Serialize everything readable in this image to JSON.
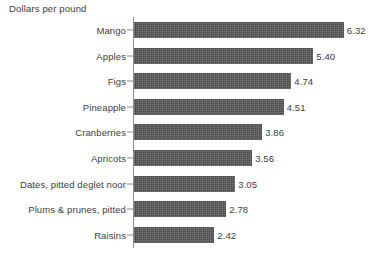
{
  "chart_data": {
    "type": "bar",
    "orientation": "horizontal",
    "title": "Dollars per pound",
    "xlabel": "",
    "ylabel": "",
    "xlim": [
      0,
      6.32
    ],
    "grid": false,
    "legend": false,
    "value_label_format": "2 decimals",
    "bar_color": "#585858",
    "axis_color": "#8c8c8c",
    "text_color": "#3d3d3d",
    "background_color": "#ffffff",
    "categories": [
      "Mango",
      "Apples",
      "Figs",
      "Pineapple",
      "Cranberries",
      "Apricots",
      "Dates, pitted deglet noor",
      "Plums & prunes, pitted",
      "Raisins"
    ],
    "values": [
      6.32,
      5.4,
      4.74,
      4.51,
      3.86,
      3.56,
      3.05,
      2.78,
      2.42
    ],
    "value_labels": [
      "6.32",
      "5.40",
      "4.74",
      "4.51",
      "3.86",
      "3.56",
      "3.05",
      "2.78",
      "2.42"
    ],
    "px_per_unit": 33.2
  }
}
